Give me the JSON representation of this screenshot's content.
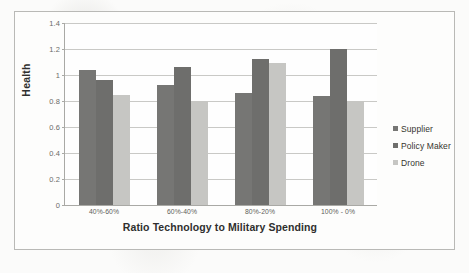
{
  "chart_data": {
    "type": "bar",
    "title": "",
    "xlabel": "Ratio Technology to Military Spending",
    "ylabel": "Health",
    "categories": [
      "40%-60%",
      "60%-40%",
      "80%-20%",
      "100% - 0%"
    ],
    "series": [
      {
        "name": "Supplier",
        "color": "#767674",
        "values": [
          1.04,
          0.92,
          0.86,
          0.84
        ]
      },
      {
        "name": "Policy Maker",
        "color": "#6e6e6c",
        "values": [
          0.96,
          1.06,
          1.12,
          1.2
        ]
      },
      {
        "name": "Drone",
        "color": "#c6c6c3",
        "values": [
          0.85,
          0.8,
          1.09,
          0.8
        ]
      }
    ],
    "ylim": [
      0,
      1.4
    ],
    "ytick_labels": [
      "0",
      "0.2",
      "0.4",
      "0.6",
      "0.8",
      "1",
      "1.2",
      "1.4"
    ],
    "ytick_values": [
      0,
      0.2,
      0.4,
      0.6,
      0.8,
      1.0,
      1.2,
      1.4
    ],
    "grid": true,
    "legend_position": "right"
  }
}
